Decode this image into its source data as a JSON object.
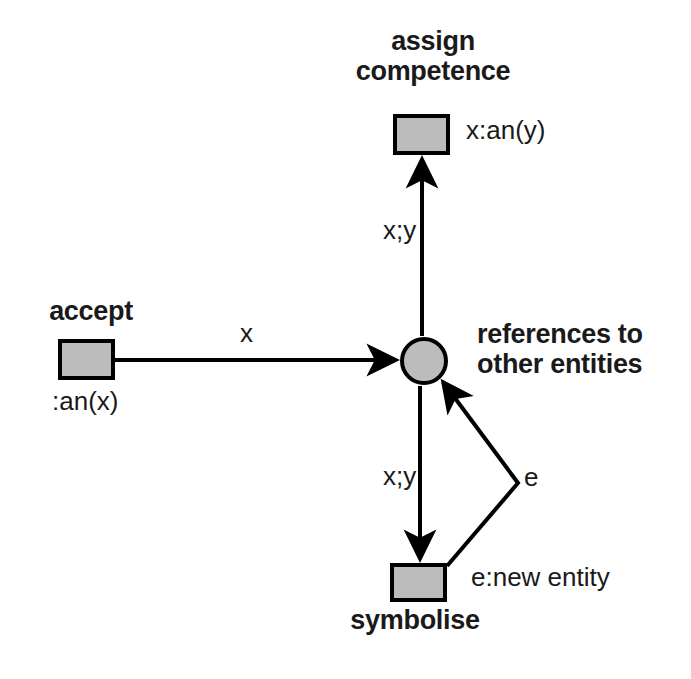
{
  "diagram": {
    "background": "#ffffff",
    "node_fill": "#bcbcbc",
    "stroke": "#000000",
    "text_color": "#1a1a1a",
    "nodes": [
      {
        "id": "assign-competence",
        "shape": "rectangle",
        "name_label": "assign\ncompetence",
        "name_line1": "assign",
        "name_line2": "competence",
        "annotation": "x:an(y)",
        "x": 393,
        "y": 114,
        "w": 57,
        "h": 41
      },
      {
        "id": "accept",
        "shape": "rectangle",
        "name_label": "accept",
        "annotation": ":an(x)",
        "x": 58,
        "y": 339,
        "w": 57,
        "h": 41
      },
      {
        "id": "references-place",
        "shape": "circle",
        "name_line1": "references to",
        "name_line2": "other entities",
        "cx": 424,
        "cy": 361,
        "r": 24
      },
      {
        "id": "symbolise",
        "shape": "rectangle",
        "name_label": "symbolise",
        "annotation": "e:new entity",
        "x": 390,
        "y": 563,
        "w": 57,
        "h": 39
      }
    ],
    "edges": [
      {
        "id": "accept-to-place",
        "from": "accept",
        "to": "references-place",
        "label": "x",
        "direction": "right"
      },
      {
        "id": "place-to-assign",
        "from": "references-place",
        "to": "assign-competence",
        "label": "x;y",
        "direction": "up"
      },
      {
        "id": "place-to-symbolise",
        "from": "references-place",
        "to": "symbolise",
        "label": "x;y",
        "direction": "down"
      },
      {
        "id": "symbolise-to-place",
        "from": "symbolise",
        "to": "references-place",
        "label": "e",
        "direction": "bent-up-left"
      }
    ]
  }
}
